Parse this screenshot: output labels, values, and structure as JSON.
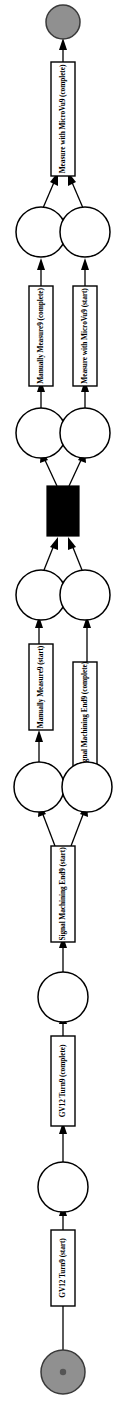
{
  "diagram": {
    "kind": "petri-net",
    "orientation": "vertical-bottom-to-top",
    "colors": {
      "terminal_place_fill": "#909090",
      "place_fill": "#ffffff",
      "transition_fill": "#ffffff",
      "silent_transition_fill": "#000000",
      "stroke": "#000000"
    },
    "places": [
      {
        "id": "p_end",
        "name": "end-place",
        "type": "terminal",
        "tokens": 0
      },
      {
        "id": "p1",
        "name": "place-1",
        "type": "normal",
        "tokens": 0
      },
      {
        "id": "p2",
        "name": "place-2",
        "type": "normal",
        "tokens": 0
      },
      {
        "id": "p3",
        "name": "place-3",
        "type": "normal",
        "tokens": 0
      },
      {
        "id": "p4",
        "name": "place-4",
        "type": "normal",
        "tokens": 0
      },
      {
        "id": "p5",
        "name": "place-5",
        "type": "normal",
        "tokens": 0
      },
      {
        "id": "p6",
        "name": "place-6",
        "type": "normal",
        "tokens": 0
      },
      {
        "id": "p7",
        "name": "place-7",
        "type": "normal",
        "tokens": 0
      },
      {
        "id": "p8",
        "name": "place-8",
        "type": "normal",
        "tokens": 0
      },
      {
        "id": "p_start",
        "name": "start-place",
        "type": "terminal",
        "tokens": 1
      }
    ],
    "transitions": [
      {
        "id": "t1",
        "label": "Measure with MicroVu9 (complete)",
        "silent": false
      },
      {
        "id": "t2",
        "label": "Manually Measure9 (complete)",
        "silent": false
      },
      {
        "id": "t3",
        "label": "Measure with MicroVu9 (start)",
        "silent": false
      },
      {
        "id": "t4",
        "label": "",
        "silent": true
      },
      {
        "id": "t5",
        "label": "Manually Measure9 (start)",
        "silent": false
      },
      {
        "id": "t6",
        "label": "Signal Machining End9 (complete)",
        "silent": false
      },
      {
        "id": "t7",
        "label": "Signal Machining End9 (start)",
        "silent": false
      },
      {
        "id": "t8",
        "label": "GV12 Turn9 (complete)",
        "silent": false
      },
      {
        "id": "t9",
        "label": "GV12 Turn9 (start)",
        "silent": false
      }
    ]
  }
}
